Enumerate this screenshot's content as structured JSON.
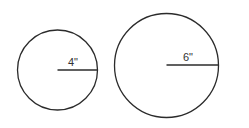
{
  "diagram": {
    "stroke_color": "#2b2b2b",
    "circles": [
      {
        "name": "small-circle",
        "cx": 57.5,
        "cy": 70,
        "r": 40,
        "radius_label": "4\"",
        "label_x": 68,
        "label_y": 66
      },
      {
        "name": "large-circle",
        "cx": 166.5,
        "cy": 65.5,
        "r": 52,
        "radius_label": "6\"",
        "label_x": 183,
        "label_y": 61
      }
    ]
  }
}
